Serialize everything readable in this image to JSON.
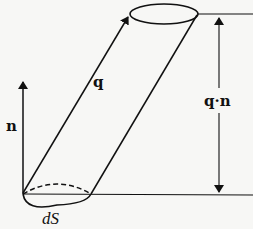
{
  "diagram": {
    "type": "flux-through-surface-element",
    "labels": {
      "q": "q",
      "n": "n",
      "qn": "q·n",
      "dS": "dS"
    },
    "colors": {
      "stroke": "#111111",
      "background": "#f7f7f5"
    }
  }
}
